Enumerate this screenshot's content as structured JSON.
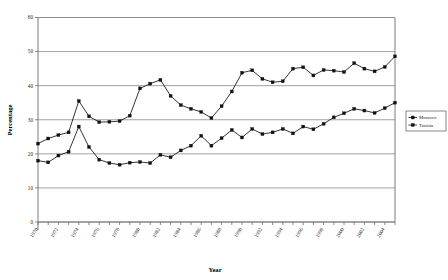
{
  "chart_data": {
    "type": "line",
    "title": "",
    "xlabel": "Year",
    "ylabel": "Percentage",
    "ylim": [
      0,
      60
    ],
    "ytick_step": 10,
    "yticks": [
      0,
      10,
      20,
      30,
      40,
      50,
      60
    ],
    "grid": "horizontal",
    "legend_position": "right",
    "xlim": [
      1970,
      2005
    ],
    "xtick_step": 2,
    "x": [
      1970,
      1971,
      1972,
      1973,
      1974,
      1975,
      1976,
      1977,
      1978,
      1979,
      1980,
      1981,
      1982,
      1983,
      1984,
      1985,
      1986,
      1987,
      1988,
      1989,
      1990,
      1991,
      1992,
      1993,
      1994,
      1995,
      1996,
      1997,
      1998,
      1999,
      2000,
      2001,
      2002,
      2003,
      2004,
      2005
    ],
    "xtick_labels": [
      "1970",
      "1972",
      "1974",
      "1976",
      "1978",
      "1980",
      "1982",
      "1984",
      "1986",
      "1988",
      "1990",
      "1992",
      "1994",
      "1996",
      "1998",
      "2000",
      "2002",
      "2004"
    ],
    "series": [
      {
        "name": "Morocco",
        "marker": "square",
        "color": "#111111",
        "values": [
          23.0,
          24.5,
          25.5,
          26.3,
          35.5,
          31.0,
          29.3,
          29.4,
          29.6,
          31.2,
          39.2,
          40.6,
          41.7,
          37.0,
          34.3,
          33.2,
          32.3,
          30.5,
          34.0,
          38.3,
          43.8,
          44.5,
          42.0,
          41.0,
          41.3,
          45.0,
          45.4,
          43.0,
          44.6,
          44.4,
          44.0,
          46.6,
          45.0,
          44.2,
          45.5,
          48.6
        ]
      },
      {
        "name": "Tunisia",
        "marker": "square",
        "color": "#111111",
        "values": [
          18.0,
          17.5,
          19.5,
          20.6,
          28.0,
          22.0,
          18.3,
          17.3,
          16.8,
          17.4,
          17.6,
          17.3,
          19.7,
          19.0,
          21.0,
          22.4,
          25.3,
          22.4,
          24.6,
          27.0,
          24.8,
          27.3,
          25.8,
          26.3,
          27.3,
          26.0,
          28.0,
          27.2,
          28.8,
          30.7,
          31.9,
          33.2,
          32.7,
          32.0,
          33.4,
          35.0
        ]
      }
    ]
  },
  "legend": {
    "items": [
      {
        "label": "Morocco"
      },
      {
        "label": "Tunisia"
      }
    ]
  }
}
